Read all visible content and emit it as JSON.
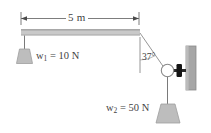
{
  "figure": {
    "background_color": "#ffffff",
    "width": 211,
    "height": 133
  },
  "labels": {
    "span_dimension": "5 m",
    "left_weight": "w",
    "left_weight_sub": "1",
    "left_weight_value": "= 10 N",
    "bottom_weight": "w",
    "bottom_weight_sub": "2",
    "bottom_weight_value": "= 50 N",
    "angle": "37°"
  },
  "colors": {
    "beam_fill": "#c9c9c9",
    "beam_edge": "#9a9a9a",
    "weight_fill": "#bdbdbd",
    "weight_edge": "#9e9e9e",
    "wall_fill": "#a6a6a6",
    "wall_edge": "#8a8a8a",
    "rod_knob": "#1a1a1a",
    "line": "#6e6e6e",
    "text": "#3f3f3f"
  },
  "elements": {
    "beam": "horizontal-beam",
    "dimension_line": "span-dimension-line",
    "left_cord": "left-hanging-cord",
    "left_weight_block": "left-weight-block",
    "diagonal_cord": "diagonal-cord",
    "vertical_reference": "vertical-reference-line",
    "ring": "ring-pulley",
    "rod": "wall-mounted-rod",
    "wall_plate": "wall-plate",
    "lower_cord": "lower-hanging-cord",
    "bottom_weight_block": "bottom-weight-block"
  }
}
